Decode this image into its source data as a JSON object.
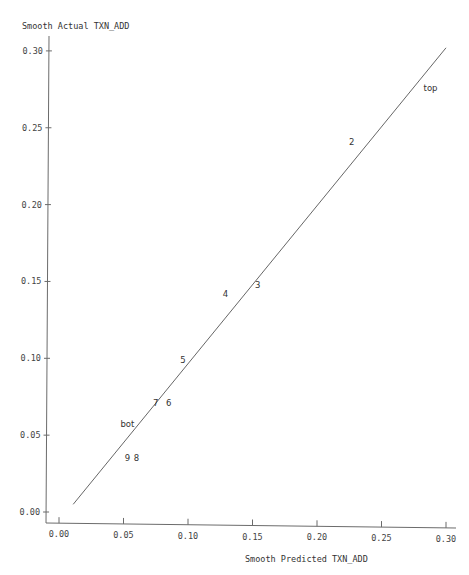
{
  "chart_data": {
    "type": "scatter",
    "title": "",
    "xlabel": "Smooth Predicted TXN_ADD",
    "ylabel": "Smooth Actual TXN_ADD",
    "xlim": [
      -0.01,
      0.31
    ],
    "ylim": [
      -0.005,
      0.305
    ],
    "x_ticks": [
      0.0,
      0.05,
      0.1,
      0.15,
      0.2,
      0.25,
      0.3
    ],
    "x_tick_labels": [
      "0.00",
      "0.05",
      "0.10",
      "0.15",
      "0.20",
      "0.25",
      "0.30"
    ],
    "y_ticks": [
      0.0,
      0.05,
      0.1,
      0.15,
      0.2,
      0.25,
      0.3
    ],
    "y_tick_labels": [
      "0.00",
      "0.05",
      "0.10",
      "0.15",
      "0.20",
      "0.25",
      "0.30"
    ],
    "grid": false,
    "legend": null,
    "points": [
      {
        "label": "top",
        "x": 0.288,
        "y": 0.276
      },
      {
        "label": "2",
        "x": 0.227,
        "y": 0.241
      },
      {
        "label": "3",
        "x": 0.154,
        "y": 0.148
      },
      {
        "label": "4",
        "x": 0.129,
        "y": 0.142
      },
      {
        "label": "5",
        "x": 0.096,
        "y": 0.099
      },
      {
        "label": "6",
        "x": 0.085,
        "y": 0.071
      },
      {
        "label": "7",
        "x": 0.075,
        "y": 0.071
      },
      {
        "label": "bot",
        "x": 0.053,
        "y": 0.057
      },
      {
        "label": "9",
        "x": 0.053,
        "y": 0.035
      },
      {
        "label": "8",
        "x": 0.06,
        "y": 0.035
      }
    ],
    "reference_line": {
      "x": [
        0.011,
        0.3
      ],
      "y": [
        0.005,
        0.302
      ]
    }
  },
  "colors": {
    "axis": "#6b6b6b",
    "line": "#555555",
    "text": "#333333"
  }
}
